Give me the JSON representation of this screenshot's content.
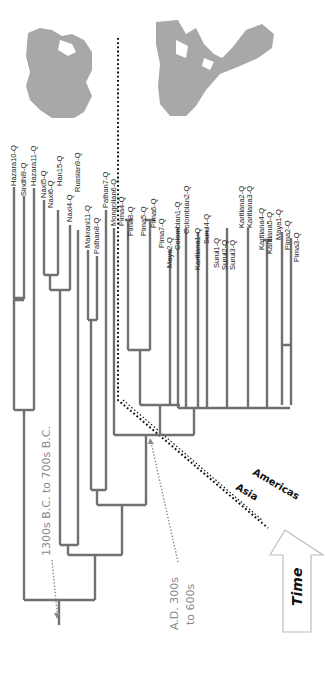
{
  "figure": {
    "orientation": "rotated-90-clockwise",
    "maps": [
      {
        "name": "asia-map",
        "region": "Asia"
      },
      {
        "name": "americas-map",
        "region": "Americas"
      }
    ],
    "leaves": [
      "Hazara10-Q",
      "Sindhi9-Q",
      "Hazara11-Q",
      "Naxi5-Q",
      "Naxi6-Q",
      "Han15-Q",
      "Naxi4-Q",
      "Russian9-Q",
      "Makrani11-Q",
      "Pathan8-Q",
      "Pathan7-Q",
      "Mongolian6-Q",
      "Pima4-Q",
      "Pima8-Q",
      "Pima5-Q",
      "Pima6-Q",
      "Pima7-Q",
      "Maya2-Q",
      "Colombian1-Q",
      "Colombian2-Q",
      "Karitiana1-Q",
      "Surui4-Q",
      "Surui1-Q",
      "Surui2-Q",
      "Surui3-Q",
      "Karitiana2-Q",
      "Karitiana3-Q",
      "Karitiana4-Q",
      "Karitiana5-Q",
      "Maya1-Q",
      "Pima2-Q",
      "Pima3-Q"
    ],
    "annotations": {
      "old_split": "1300s B.C. to 700s B.C.",
      "young_split_line1": "A.D. 300s",
      "young_split_line2": "to 600s",
      "region_asia": "Asia",
      "region_americas": "Americas",
      "time_arrow": "Time"
    },
    "colors": {
      "branch": "#707070",
      "map_land": "#a8a8a8",
      "annotation": "#8a8a8a",
      "divider": "#111111"
    }
  }
}
